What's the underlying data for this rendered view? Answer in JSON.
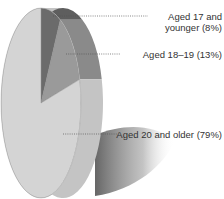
{
  "chart_data": {
    "type": "pie",
    "title": "",
    "categories": [
      "Aged 17 and younger",
      "Aged 18–19",
      "Aged 20 and older"
    ],
    "values": [
      8,
      13,
      79
    ],
    "unit": "%",
    "labels": [
      {
        "line1": "Aged 17 and",
        "line2": "younger (8%)"
      },
      {
        "line1": "Aged 18–19 (13%)"
      },
      {
        "line1": "Aged 20 and older (79%)"
      }
    ],
    "colors": [
      "#6b6b6b",
      "#9a9a9a",
      "#d4d4d4"
    ],
    "edge_colors": [
      "#5e5e5e",
      "#8a8a8a",
      "#c4c4c4"
    ],
    "legend": "none",
    "style": "3d-tilted"
  }
}
